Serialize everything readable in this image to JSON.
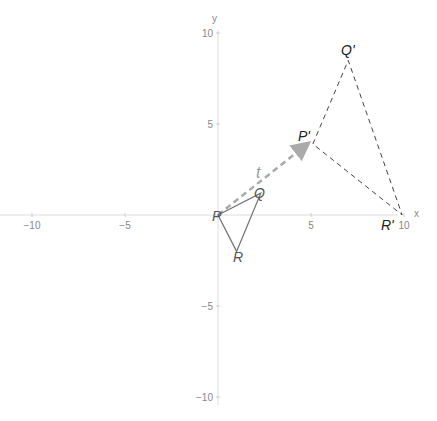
{
  "axes": {
    "x_label": "x",
    "y_label": "y",
    "x_ticks": [
      {
        "value": -10,
        "label": "−10"
      },
      {
        "value": -5,
        "label": "−5"
      },
      {
        "value": 5,
        "label": "5"
      },
      {
        "value": 10,
        "label": "10"
      }
    ],
    "y_ticks": [
      {
        "value": 10,
        "label": "10"
      },
      {
        "value": 5,
        "label": "5"
      },
      {
        "value": -5,
        "label": "−5"
      },
      {
        "value": -10,
        "label": "−10"
      }
    ],
    "xlim": [
      -11.7,
      11.8
    ],
    "ylim": [
      -11.3,
      11.8
    ]
  },
  "original_triangle": {
    "labels": {
      "P": "P",
      "Q": "Q",
      "R": "R"
    },
    "points": {
      "P": [
        0,
        0
      ],
      "Q": [
        2.3,
        1.2
      ],
      "R": [
        1,
        -2
      ]
    }
  },
  "image_triangle": {
    "labels": {
      "P": "P'",
      "Q": "Q'",
      "R": "R'"
    },
    "points": {
      "P": [
        5.1,
        3.9
      ],
      "Q": [
        7,
        8.5
      ],
      "R": [
        9.9,
        0
      ]
    }
  },
  "vector": {
    "label": "t",
    "from": [
      0,
      0
    ],
    "to": [
      4.8,
      3.9
    ]
  },
  "colors": {
    "axis": "#d9d9d9",
    "tick_text": "#888888",
    "original": "#707070",
    "image": "#444444",
    "vector": "#aaaaaa",
    "labels": "#333333"
  }
}
